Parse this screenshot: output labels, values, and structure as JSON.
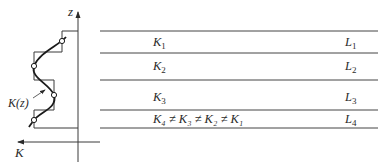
{
  "diagram": {
    "axes": {
      "vertical_label": "z",
      "horizontal_label": "K"
    },
    "curve_label": "K(z)",
    "layers": [
      {
        "k_label": "K",
        "k_sub": "1",
        "l_label": "L",
        "l_sub": "1"
      },
      {
        "k_label": "K",
        "k_sub": "2",
        "l_label": "L",
        "l_sub": "2"
      },
      {
        "k_label": "K",
        "k_sub": "3",
        "l_label": "L",
        "l_sub": "3"
      },
      {
        "k_label": "K₄ ≠ K₃ ≠ K₂ ≠ K₁",
        "k_sub": "",
        "l_label": "L",
        "l_sub": "4"
      }
    ],
    "colors": {
      "line": "#3a3a3a",
      "background": "#ffffff"
    }
  }
}
